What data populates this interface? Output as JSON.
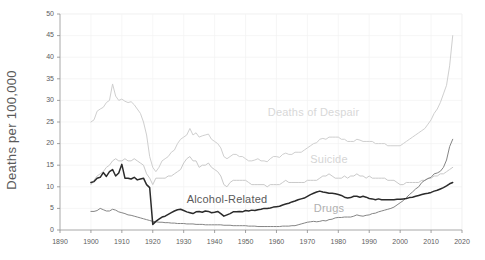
{
  "chart_data": {
    "type": "line",
    "title": "",
    "xlabel": "",
    "ylabel": "Deaths per 100,000",
    "xlim": [
      1890,
      2020
    ],
    "ylim": [
      0,
      50
    ],
    "xticks": [
      1890,
      1900,
      1910,
      1920,
      1930,
      1940,
      1950,
      1960,
      1970,
      1980,
      1990,
      2000,
      2010,
      2020
    ],
    "yticks": [
      0,
      5,
      10,
      15,
      20,
      25,
      30,
      35,
      40,
      45,
      50
    ],
    "grid": true,
    "legend_position": "inline-annotations",
    "series": [
      {
        "name": "Deaths of Despair",
        "color": "#cfcfcf",
        "label_x": 1972,
        "label_y": 26.5,
        "label_color": "#d8d8d8",
        "x": [
          1900,
          1901,
          1902,
          1903,
          1904,
          1905,
          1906,
          1907,
          1908,
          1909,
          1910,
          1911,
          1912,
          1913,
          1914,
          1915,
          1916,
          1917,
          1918,
          1919,
          1920,
          1921,
          1922,
          1923,
          1924,
          1925,
          1926,
          1927,
          1928,
          1929,
          1930,
          1931,
          1932,
          1933,
          1934,
          1935,
          1936,
          1937,
          1938,
          1939,
          1940,
          1941,
          1942,
          1943,
          1944,
          1945,
          1946,
          1947,
          1948,
          1949,
          1950,
          1951,
          1952,
          1953,
          1954,
          1955,
          1956,
          1957,
          1958,
          1959,
          1960,
          1961,
          1962,
          1963,
          1964,
          1965,
          1966,
          1967,
          1968,
          1969,
          1970,
          1971,
          1972,
          1973,
          1974,
          1975,
          1976,
          1977,
          1978,
          1979,
          1980,
          1981,
          1982,
          1983,
          1984,
          1985,
          1986,
          1987,
          1988,
          1989,
          1990,
          1991,
          1992,
          1993,
          1994,
          1995,
          1996,
          1997,
          1998,
          1999,
          2000,
          2001,
          2002,
          2003,
          2004,
          2005,
          2006,
          2007,
          2008,
          2009,
          2010,
          2011,
          2012,
          2013,
          2014,
          2015,
          2016,
          2017
        ],
        "y": [
          25.0,
          25.5,
          27.5,
          28.0,
          28.4,
          29.5,
          30.0,
          33.8,
          31.0,
          30.0,
          30.3,
          29.8,
          29.5,
          29.7,
          29.0,
          28.0,
          27.0,
          25.0,
          22.0,
          17.0,
          14.5,
          13.5,
          14.5,
          16.0,
          16.5,
          17.0,
          18.0,
          18.5,
          20.0,
          21.0,
          21.5,
          22.0,
          23.5,
          22.0,
          22.5,
          21.5,
          21.8,
          22.0,
          22.2,
          21.0,
          20.5,
          20.0,
          19.0,
          17.0,
          16.5,
          17.0,
          17.5,
          17.5,
          17.0,
          17.0,
          16.5,
          16.0,
          16.0,
          16.2,
          16.5,
          16.0,
          16.0,
          15.8,
          16.5,
          17.0,
          17.0,
          16.8,
          17.5,
          17.8,
          17.5,
          17.5,
          18.0,
          18.0,
          18.0,
          18.5,
          19.0,
          19.5,
          20.0,
          20.2,
          21.0,
          21.2,
          21.0,
          21.5,
          21.5,
          21.5,
          21.5,
          21.0,
          21.0,
          20.5,
          20.5,
          20.5,
          21.0,
          20.8,
          20.5,
          20.5,
          20.5,
          20.5,
          20.0,
          20.0,
          20.0,
          20.0,
          19.5,
          19.5,
          19.5,
          19.5,
          19.5,
          20.0,
          20.5,
          21.0,
          21.5,
          22.0,
          22.5,
          23.0,
          23.5,
          24.5,
          25.5,
          27.0,
          28.0,
          29.5,
          31.5,
          33.5,
          38.0,
          45.0
        ]
      },
      {
        "name": "Suicide",
        "color": "#c9c9c9",
        "label_x": 1977,
        "label_y": 15.5,
        "label_color": "#d5d5d5",
        "x": [
          1900,
          1901,
          1902,
          1903,
          1904,
          1905,
          1906,
          1907,
          1908,
          1909,
          1910,
          1911,
          1912,
          1913,
          1914,
          1915,
          1916,
          1917,
          1918,
          1919,
          1920,
          1921,
          1922,
          1923,
          1924,
          1925,
          1926,
          1927,
          1928,
          1929,
          1930,
          1931,
          1932,
          1933,
          1934,
          1935,
          1936,
          1937,
          1938,
          1939,
          1940,
          1941,
          1942,
          1943,
          1944,
          1945,
          1946,
          1947,
          1948,
          1949,
          1950,
          1951,
          1952,
          1953,
          1954,
          1955,
          1956,
          1957,
          1958,
          1959,
          1960,
          1961,
          1962,
          1963,
          1964,
          1965,
          1966,
          1967,
          1968,
          1969,
          1970,
          1971,
          1972,
          1973,
          1974,
          1975,
          1976,
          1977,
          1978,
          1979,
          1980,
          1981,
          1982,
          1983,
          1984,
          1985,
          1986,
          1987,
          1988,
          1989,
          1990,
          1991,
          1992,
          1993,
          1994,
          1995,
          1996,
          1997,
          1998,
          1999,
          2000,
          2001,
          2002,
          2003,
          2004,
          2005,
          2006,
          2007,
          2008,
          2009,
          2010,
          2011,
          2012,
          2013,
          2014,
          2015,
          2016,
          2017
        ],
        "y": [
          10.5,
          11.5,
          12.5,
          13.0,
          13.5,
          14.5,
          15.0,
          16.0,
          16.5,
          16.0,
          16.0,
          16.5,
          16.0,
          16.0,
          16.5,
          16.0,
          15.5,
          15.0,
          13.0,
          12.0,
          10.5,
          12.0,
          12.0,
          12.0,
          12.0,
          12.5,
          12.5,
          13.0,
          13.5,
          14.0,
          15.5,
          16.5,
          17.0,
          16.0,
          16.0,
          14.5,
          15.0,
          15.0,
          15.5,
          14.5,
          14.0,
          13.5,
          12.5,
          10.5,
          10.0,
          11.0,
          11.5,
          11.5,
          11.5,
          11.5,
          11.5,
          11.0,
          10.5,
          10.5,
          10.5,
          10.5,
          10.5,
          10.0,
          10.5,
          10.5,
          10.5,
          10.5,
          11.0,
          11.5,
          11.0,
          11.0,
          11.0,
          11.0,
          11.0,
          11.0,
          11.5,
          11.5,
          11.5,
          11.5,
          12.0,
          12.5,
          12.5,
          13.0,
          12.5,
          12.0,
          12.0,
          12.0,
          12.5,
          12.0,
          12.5,
          12.5,
          13.0,
          12.5,
          12.5,
          12.0,
          12.5,
          12.0,
          12.0,
          12.0,
          12.0,
          12.0,
          11.5,
          11.5,
          11.5,
          11.0,
          10.5,
          10.5,
          11.0,
          11.0,
          11.0,
          11.0,
          11.0,
          11.5,
          11.5,
          12.0,
          12.0,
          12.5,
          12.5,
          13.0,
          13.0,
          13.5,
          14.0,
          14.5
        ]
      },
      {
        "name": "Alcohol-Related",
        "color": "#2b2b2b",
        "label_x": 1944,
        "label_y": 6.2,
        "label_color": "#5a5a5a",
        "x": [
          1900,
          1901,
          1902,
          1903,
          1904,
          1905,
          1906,
          1907,
          1908,
          1909,
          1910,
          1911,
          1912,
          1913,
          1914,
          1915,
          1916,
          1917,
          1918,
          1919,
          1920,
          1921,
          1922,
          1923,
          1924,
          1925,
          1926,
          1927,
          1928,
          1929,
          1930,
          1931,
          1932,
          1933,
          1934,
          1935,
          1936,
          1937,
          1938,
          1939,
          1940,
          1941,
          1942,
          1943,
          1944,
          1945,
          1946,
          1947,
          1948,
          1949,
          1950,
          1951,
          1952,
          1953,
          1954,
          1955,
          1956,
          1957,
          1958,
          1959,
          1960,
          1961,
          1962,
          1963,
          1964,
          1965,
          1966,
          1967,
          1968,
          1969,
          1970,
          1971,
          1972,
          1973,
          1974,
          1975,
          1976,
          1977,
          1978,
          1979,
          1980,
          1981,
          1982,
          1983,
          1984,
          1985,
          1986,
          1987,
          1988,
          1989,
          1990,
          1991,
          1992,
          1993,
          1994,
          1995,
          1996,
          1997,
          1998,
          1999,
          2000,
          2001,
          2002,
          2003,
          2004,
          2005,
          2006,
          2007,
          2008,
          2009,
          2010,
          2011,
          2012,
          2013,
          2014,
          2015,
          2016,
          2017
        ],
        "y": [
          11.0,
          11.2,
          12.0,
          12.2,
          13.3,
          12.4,
          13.5,
          14.0,
          12.5,
          13.2,
          15.2,
          12.0,
          12.0,
          11.8,
          12.2,
          11.6,
          11.8,
          12.0,
          10.5,
          9.8,
          1.3,
          2.0,
          2.5,
          3.0,
          3.2,
          3.6,
          4.0,
          4.4,
          4.7,
          4.8,
          4.5,
          4.2,
          4.0,
          3.8,
          4.2,
          4.3,
          4.1,
          4.4,
          4.3,
          4.0,
          4.1,
          4.3,
          3.8,
          3.2,
          3.5,
          3.8,
          4.2,
          4.2,
          4.3,
          4.2,
          4.5,
          4.4,
          4.6,
          4.5,
          4.7,
          4.8,
          5.0,
          5.0,
          5.1,
          5.3,
          5.4,
          5.5,
          5.8,
          6.0,
          6.2,
          6.5,
          6.7,
          7.0,
          7.2,
          7.4,
          7.8,
          8.2,
          8.5,
          8.8,
          9.0,
          8.8,
          8.7,
          8.5,
          8.5,
          8.4,
          8.2,
          8.0,
          7.6,
          7.4,
          7.5,
          7.8,
          7.8,
          7.6,
          7.8,
          7.6,
          7.3,
          7.2,
          7.0,
          7.2,
          7.0,
          7.0,
          7.0,
          7.0,
          7.0,
          7.1,
          7.1,
          7.2,
          7.3,
          7.5,
          7.6,
          7.8,
          8.0,
          8.2,
          8.4,
          8.5,
          8.7,
          9.0,
          9.2,
          9.5,
          9.8,
          10.2,
          10.7,
          11.0
        ]
      },
      {
        "name": "Drugs",
        "color": "#858585",
        "label_x": 1977,
        "label_y": 4.2,
        "label_color": "#b0b0b0",
        "x": [
          1900,
          1901,
          1902,
          1903,
          1904,
          1905,
          1906,
          1907,
          1908,
          1909,
          1910,
          1911,
          1912,
          1913,
          1914,
          1915,
          1916,
          1917,
          1918,
          1919,
          1920,
          1921,
          1922,
          1923,
          1924,
          1925,
          1926,
          1927,
          1928,
          1929,
          1930,
          1931,
          1932,
          1933,
          1934,
          1935,
          1936,
          1937,
          1938,
          1939,
          1940,
          1941,
          1942,
          1943,
          1944,
          1945,
          1946,
          1947,
          1948,
          1949,
          1950,
          1951,
          1952,
          1953,
          1954,
          1955,
          1956,
          1957,
          1958,
          1959,
          1960,
          1961,
          1962,
          1963,
          1964,
          1965,
          1966,
          1967,
          1968,
          1969,
          1970,
          1971,
          1972,
          1973,
          1974,
          1975,
          1976,
          1977,
          1978,
          1979,
          1980,
          1981,
          1982,
          1983,
          1984,
          1985,
          1986,
          1987,
          1988,
          1989,
          1990,
          1991,
          1992,
          1993,
          1994,
          1995,
          1996,
          1997,
          1998,
          1999,
          2000,
          2001,
          2002,
          2003,
          2004,
          2005,
          2006,
          2007,
          2008,
          2009,
          2010,
          2011,
          2012,
          2013,
          2014,
          2015,
          2016,
          2017
        ],
        "y": [
          4.3,
          4.3,
          4.5,
          5.0,
          4.7,
          4.4,
          4.4,
          4.8,
          4.6,
          4.2,
          4.0,
          3.8,
          3.5,
          3.4,
          3.2,
          3.0,
          2.8,
          2.6,
          2.4,
          2.2,
          2.0,
          1.9,
          1.8,
          1.8,
          1.7,
          1.7,
          1.6,
          1.6,
          1.5,
          1.5,
          1.5,
          1.4,
          1.4,
          1.4,
          1.3,
          1.3,
          1.3,
          1.2,
          1.2,
          1.2,
          1.2,
          1.2,
          1.2,
          1.1,
          1.1,
          1.1,
          1.0,
          1.0,
          1.0,
          1.0,
          1.0,
          0.9,
          0.9,
          0.9,
          0.8,
          0.8,
          0.8,
          0.8,
          0.8,
          0.8,
          0.8,
          0.8,
          0.9,
          0.9,
          0.9,
          1.0,
          1.0,
          1.2,
          1.4,
          1.6,
          1.8,
          1.9,
          2.0,
          1.9,
          2.0,
          2.2,
          2.1,
          2.4,
          2.5,
          2.8,
          2.9,
          2.9,
          3.0,
          3.0,
          3.0,
          3.2,
          3.5,
          3.3,
          3.2,
          3.4,
          3.5,
          3.8,
          3.9,
          4.2,
          4.4,
          4.6,
          4.8,
          5.0,
          5.3,
          5.8,
          6.3,
          6.8,
          7.5,
          8.2,
          8.8,
          9.5,
          10.0,
          11.0,
          11.5,
          11.9,
          12.2,
          13.0,
          13.2,
          13.6,
          14.5,
          16.2,
          19.3,
          21.0
        ]
      }
    ]
  },
  "axis": {
    "ylabel_text": "Deaths per 100,000",
    "ytick_labels": [
      "0",
      "5",
      "10",
      "15",
      "20",
      "25",
      "30",
      "35",
      "40",
      "45",
      "50"
    ],
    "xtick_labels": [
      "1890",
      "1900",
      "1910",
      "1920",
      "1930",
      "1940",
      "1950",
      "1960",
      "1970",
      "1980",
      "1990",
      "2000",
      "2010",
      "2020"
    ]
  },
  "annotations": {
    "despair": "Deaths of Despair",
    "suicide": "Suicide",
    "alcohol": "Alcohol-Related",
    "drugs": "Drugs"
  }
}
